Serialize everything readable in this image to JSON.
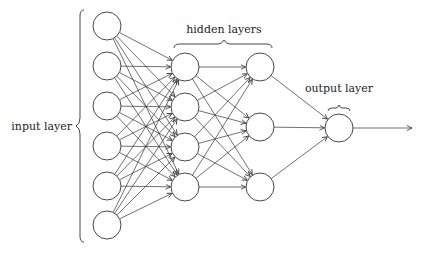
{
  "diagram": {
    "labels": {
      "input": "input layer",
      "hidden": "hidden layers",
      "output": "output layer"
    },
    "layers": [
      {
        "name": "input",
        "x": 107,
        "ys": [
          26,
          66,
          106,
          146,
          186,
          225
        ]
      },
      {
        "name": "hidden1",
        "x": 185,
        "ys": [
          67,
          107,
          147,
          187
        ]
      },
      {
        "name": "hidden2",
        "x": 260,
        "ys": [
          67,
          127,
          187
        ]
      },
      {
        "name": "output",
        "x": 339,
        "ys": [
          128
        ]
      }
    ],
    "node_radius": 14,
    "output_arrow_end_x": 412,
    "colors": {
      "stroke": "#333333",
      "background": "#ffffff"
    }
  }
}
